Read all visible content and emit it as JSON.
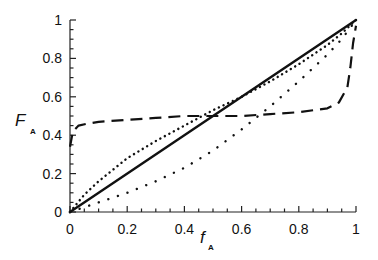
{
  "chart_data": {
    "type": "line",
    "title": "",
    "xlabel": "f",
    "xlabel_subscript": "A",
    "ylabel": "F",
    "ylabel_subscript": "A",
    "xlim": [
      0,
      1
    ],
    "ylim": [
      0,
      1
    ],
    "grid": false,
    "legend": null,
    "x_ticks": [
      "0",
      "0.2",
      "0.4",
      "0.6",
      "0.8",
      "1"
    ],
    "y_ticks": [
      "0",
      "0.2",
      "0.4",
      "0.6",
      "0.8",
      "1"
    ],
    "series": [
      {
        "name": "ideal (solid)",
        "style": "solid",
        "x": [
          0,
          1
        ],
        "y": [
          0,
          1
        ]
      },
      {
        "name": "dense dotted (above diagonal)",
        "style": "dotted-dense",
        "x": [
          0,
          0.05,
          0.1,
          0.2,
          0.3,
          0.4,
          0.5,
          0.6,
          0.7,
          0.8,
          0.9,
          0.95,
          1
        ],
        "y": [
          0,
          0.09,
          0.16,
          0.28,
          0.37,
          0.45,
          0.53,
          0.6,
          0.68,
          0.77,
          0.87,
          0.93,
          1
        ]
      },
      {
        "name": "sparse dotted (below diagonal)",
        "style": "dotted-sparse",
        "x": [
          0,
          0.1,
          0.2,
          0.3,
          0.4,
          0.5,
          0.6,
          0.7,
          0.8,
          0.9,
          0.95,
          1
        ],
        "y": [
          0,
          0.05,
          0.1,
          0.16,
          0.23,
          0.32,
          0.43,
          0.55,
          0.68,
          0.82,
          0.9,
          1
        ]
      },
      {
        "name": "dashed (alternating)",
        "style": "dashed",
        "x": [
          0,
          0.01,
          0.03,
          0.06,
          0.1,
          0.2,
          0.3,
          0.4,
          0.5,
          0.6,
          0.7,
          0.8,
          0.9,
          0.94,
          0.97,
          0.98,
          0.99,
          1
        ],
        "y": [
          0.34,
          0.42,
          0.45,
          0.46,
          0.47,
          0.48,
          0.49,
          0.5,
          0.5,
          0.5,
          0.51,
          0.52,
          0.54,
          0.57,
          0.65,
          0.75,
          0.88,
          0.97
        ]
      }
    ]
  }
}
